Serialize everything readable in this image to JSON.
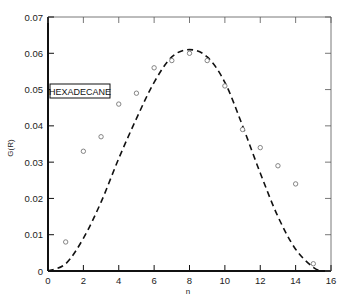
{
  "chart_data": {
    "type": "scatter",
    "title": "",
    "annotation": "HEXADECANE",
    "xlabel": "n",
    "ylabel": "G(R)",
    "xlim": [
      0,
      16
    ],
    "ylim": [
      0,
      0.07
    ],
    "grid": false,
    "x_ticks": [
      0,
      2,
      4,
      6,
      8,
      10,
      12,
      14,
      16
    ],
    "x_tick_labels": [
      "0",
      "2",
      "4",
      "6",
      "8",
      "10",
      "12",
      "14",
      "16"
    ],
    "y_ticks": [
      0,
      0.01,
      0.02,
      0.03,
      0.04,
      0.05,
      0.06,
      0.07
    ],
    "y_tick_labels": [
      "0",
      "0.01",
      "0.02",
      "0.03",
      "0.04",
      "0.05",
      "0.06",
      "0.07"
    ],
    "series": [
      {
        "name": "data points",
        "style": "open-circle",
        "x": [
          1,
          2,
          3,
          4,
          5,
          6,
          7,
          8,
          9,
          10,
          11,
          12,
          13,
          14,
          15
        ],
        "values": [
          0.008,
          0.033,
          0.037,
          0.046,
          0.049,
          0.056,
          0.058,
          0.06,
          0.058,
          0.051,
          0.039,
          0.034,
          0.029,
          0.024,
          0.002
        ]
      },
      {
        "name": "theoretical curve",
        "style": "dashed-line",
        "x": [
          0,
          1,
          2,
          3,
          4,
          5,
          6,
          7,
          8,
          9,
          10,
          11,
          12,
          13,
          14,
          15,
          15.5
        ],
        "values": [
          0.0,
          0.002,
          0.009,
          0.019,
          0.031,
          0.042,
          0.052,
          0.059,
          0.061,
          0.059,
          0.052,
          0.04,
          0.027,
          0.015,
          0.006,
          0.001,
          0.0
        ]
      }
    ]
  },
  "colors": {
    "axis": "#222222",
    "points": "#777777",
    "curve": "#111111",
    "background": "#ffffff"
  }
}
